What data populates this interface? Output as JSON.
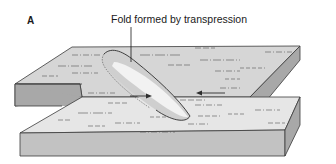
{
  "figure": {
    "panel_label": "A",
    "caption": "Fold formed by transpression",
    "colors": {
      "top_face": "#d9d9d9",
      "top_face_light": "#ececec",
      "side_face": "#a9a9a9",
      "front_face": "#c4c4c4",
      "outline": "#3a3a3a",
      "fold_highlight": "#f4f4f4"
    },
    "elements": {
      "upper_block": "back-left crustal block",
      "lower_block": "front-right crustal block",
      "fold": "elongate anticlinal fold at block boundary",
      "leader_line": "pointer from caption to fold",
      "arrows": "relative motion arrows"
    }
  }
}
